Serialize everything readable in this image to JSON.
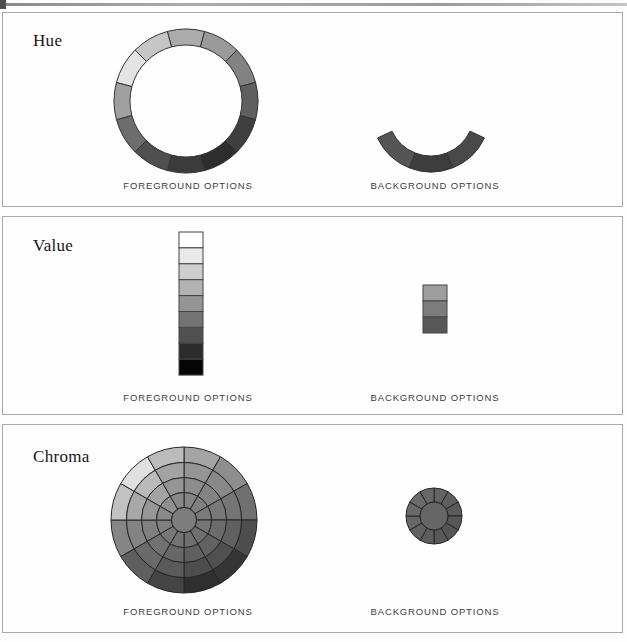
{
  "panels": [
    {
      "title": "Hue",
      "foreground_label": "FOREGROUND OPTIONS",
      "background_label": "BACKGROUND OPTIONS"
    },
    {
      "title": "Value",
      "foreground_label": "FOREGROUND OPTIONS",
      "background_label": "BACKGROUND OPTIONS"
    },
    {
      "title": "Chroma",
      "foreground_label": "FOREGROUND OPTIONS",
      "background_label": "BACKGROUND OPTIONS"
    }
  ],
  "graphics": {
    "hue_foreground_ring": {
      "type": "ring",
      "cx": 183,
      "cy": 88,
      "outer_r": 72,
      "inner_r": 56,
      "start_angle": -15,
      "stroke": "#333333",
      "colors": [
        "#ababab",
        "#9a9a9a",
        "#828282",
        "#5f5f5f",
        "#3f3f3f",
        "#2d2d2d",
        "#3b3b3b",
        "#4f4f4f",
        "#6d6d6d",
        "#a0a0a0",
        "#e4e4e4",
        "#c6c6c6"
      ]
    },
    "hue_background_arc": {
      "type": "ring",
      "cx": 428,
      "cy": 100,
      "outer_r": 59,
      "inner_r": 43,
      "start_angle": 115,
      "end_angle": 245,
      "stroke": "#333333",
      "colors": [
        "#494949",
        "#3d3d3d",
        "#555555"
      ]
    },
    "value_foreground_scale": {
      "type": "bar",
      "x": 176,
      "y": 15,
      "width": 24,
      "segment_height": 15.9,
      "stroke": "#454545",
      "colors": [
        "#ffffff",
        "#e9e9e9",
        "#cecece",
        "#b2b2b2",
        "#949494",
        "#737373",
        "#515151",
        "#2c2c2c",
        "#050505"
      ]
    },
    "value_background_scale": {
      "type": "bar",
      "x": 420,
      "y": 68,
      "width": 24,
      "segment_height": 16,
      "stroke": "#454545",
      "colors": [
        "#9e9e9e",
        "#7c7c7c",
        "#575757"
      ]
    },
    "chroma_foreground_wheel": {
      "type": "wheel",
      "cx": 181,
      "cy": 95,
      "radii": [
        12.5,
        27.5,
        42.5,
        57.5,
        73
      ],
      "start_angle": 0,
      "stroke": "#262626",
      "outer_colors": [
        "#a4a4a4",
        "#8e8e8e",
        "#707070",
        "#4e4e4e",
        "#353535",
        "#2f2f2f",
        "#444444",
        "#5e5e5e",
        "#868686",
        "#c2c2c2",
        "#e0e0e0",
        "#bbbbbb"
      ],
      "ring_mix": [
        0,
        0.38,
        0.62,
        0.82
      ],
      "mix_target": "#7d7d7d",
      "center_color": "#7d7d7d"
    },
    "chroma_background_wheel": {
      "type": "wheel",
      "cx": 431,
      "cy": 91,
      "radii": [
        14,
        28
      ],
      "start_angle": 0,
      "stroke": "#262626",
      "outer_colors": [
        "#646464",
        "#606060",
        "#5b5b5b",
        "#575757",
        "#555555",
        "#585858",
        "#5d5d5d",
        "#626262",
        "#676767",
        "#6a6a6a",
        "#6b6b6b",
        "#686868"
      ],
      "ring_mix": [
        0
      ],
      "mix_target": "#666666",
      "center_color": "#666666"
    }
  }
}
